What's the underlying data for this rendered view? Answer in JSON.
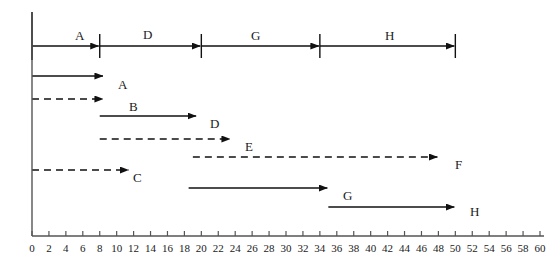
{
  "figure": {
    "kind": "activity-network-and-gantt",
    "ink_color": "#111111",
    "axis_color": "#555555"
  },
  "chart_data": {
    "type": "bar",
    "title": "",
    "subtitle": "",
    "xlabel": "",
    "ylabel": "",
    "xlim": [
      0,
      60
    ],
    "grid": false,
    "legend_position": "none",
    "x_ticks": [
      0,
      2,
      4,
      6,
      8,
      10,
      12,
      14,
      16,
      18,
      20,
      22,
      24,
      26,
      28,
      30,
      32,
      34,
      36,
      38,
      40,
      42,
      44,
      46,
      48,
      50,
      52,
      54,
      56,
      58,
      60
    ],
    "x_tick_labels": [
      "0",
      "2",
      "4",
      "6",
      "8",
      "10",
      "12",
      "14",
      "16",
      "18",
      "20",
      "22",
      "24",
      "26",
      "28",
      "30",
      "32",
      "34",
      "36",
      "38",
      "40",
      "42",
      "44",
      "46",
      "48",
      "50",
      "52",
      "54",
      "56",
      "58",
      "60"
    ],
    "critical_path": {
      "description": "Critical path chain drawn at top as arrows between event nodes",
      "nodes": [
        0,
        8,
        20,
        34,
        50
      ],
      "segments": [
        {
          "label": "A",
          "start": 0,
          "finish": 8,
          "style": "solid"
        },
        {
          "label": "D",
          "start": 8,
          "finish": 20,
          "style": "solid"
        },
        {
          "label": "G",
          "start": 20,
          "finish": 34,
          "style": "solid"
        },
        {
          "label": "H",
          "start": 34,
          "finish": 50,
          "style": "solid"
        }
      ]
    },
    "categories": [
      "A",
      "B",
      "D",
      "E",
      "C",
      "F",
      "G",
      "H"
    ],
    "bars": [
      {
        "label": "A",
        "start": 0,
        "finish": 8.5,
        "style": "solid",
        "arrow": true
      },
      {
        "label": "B",
        "start": 0,
        "finish": 8.5,
        "style": "dashed",
        "arrow": true
      },
      {
        "label": "D",
        "start": 8,
        "finish": 19.5,
        "style": "solid",
        "arrow": true
      },
      {
        "label": "E",
        "start": 8,
        "finish": 23.5,
        "style": "dashed",
        "arrow": true
      },
      {
        "label": "C",
        "start": 0,
        "finish": 11.5,
        "style": "dashed",
        "arrow": true
      },
      {
        "label": "F",
        "start": 19,
        "finish": 48,
        "style": "dashed",
        "arrow": true
      },
      {
        "label": "G",
        "start": 18.5,
        "finish": 35,
        "style": "solid",
        "arrow": true
      },
      {
        "label": "H",
        "start": 35,
        "finish": 50,
        "style": "solid",
        "arrow": true
      }
    ]
  },
  "network_labels": [
    {
      "text": "A",
      "x": 75,
      "y": 29
    },
    {
      "text": "D",
      "x": 143,
      "y": 28
    },
    {
      "text": "G",
      "x": 251,
      "y": 29
    },
    {
      "text": "H",
      "x": 385,
      "y": 29
    }
  ],
  "bar_labels": [
    {
      "text": "A",
      "x": 118,
      "y": 78
    },
    {
      "text": "B",
      "x": 129,
      "y": 100
    },
    {
      "text": "D",
      "x": 210,
      "y": 117
    },
    {
      "text": "E",
      "x": 245,
      "y": 140
    },
    {
      "text": "C",
      "x": 133,
      "y": 171
    },
    {
      "text": "F",
      "x": 455,
      "y": 158
    },
    {
      "text": "G",
      "x": 343,
      "y": 189
    },
    {
      "text": "H",
      "x": 470,
      "y": 205
    }
  ]
}
